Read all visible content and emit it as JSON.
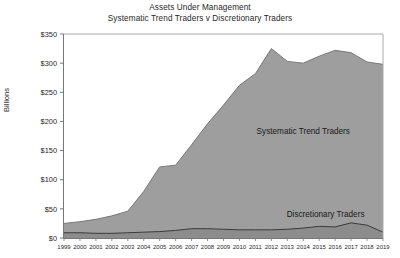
{
  "chart_data": {
    "type": "area",
    "title": "Assets Under Management",
    "subtitle": "Systematic Trend Traders v Discretionary Traders",
    "xlabel": "",
    "ylabel": "Billions",
    "ylim": [
      0,
      350
    ],
    "ytick_labels": [
      "$0",
      "$50",
      "$100",
      "$150",
      "$200",
      "$250",
      "$300",
      "$350"
    ],
    "ytick_values": [
      0,
      50,
      100,
      150,
      200,
      250,
      300,
      350
    ],
    "grid": false,
    "legend_position": "inline-annotation",
    "categories": [
      "1999",
      "2000",
      "2001",
      "2002",
      "2003",
      "2004",
      "2005",
      "2006",
      "2007",
      "2008",
      "2009",
      "2010",
      "2011",
      "2012",
      "2013",
      "2014",
      "2015",
      "2016",
      "2017",
      "2018",
      "2019"
    ],
    "series": [
      {
        "name": "Systematic Trend Traders",
        "fill_color": "#9e9e9e",
        "line_color": "#6e6e6e",
        "values": [
          25,
          28,
          32,
          38,
          46,
          80,
          122,
          125,
          160,
          196,
          228,
          262,
          282,
          325,
          303,
          300,
          312,
          322,
          318,
          302,
          298
        ]
      },
      {
        "name": "Discretionary Traders",
        "fill_color": "#8c8c8c",
        "line_color": "#3a3a3a",
        "values": [
          9,
          9,
          8,
          8,
          9,
          10,
          11,
          13,
          16,
          16,
          15,
          14,
          14,
          14,
          15,
          17,
          20,
          19,
          26,
          22,
          10
        ]
      }
    ],
    "annotations": [
      {
        "text": "Systematic Trend Traders",
        "x_year": 2014,
        "y_value": 178
      },
      {
        "text": "Discretionary Traders",
        "x_year": 2015.4,
        "y_value": 36
      }
    ]
  }
}
